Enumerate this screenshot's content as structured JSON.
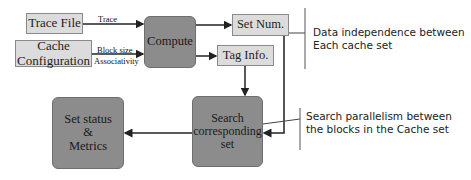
{
  "diagram": {
    "nodes": {
      "trace_file": {
        "label": "Trace File"
      },
      "cache_config": {
        "line1": "Cache",
        "line2": "Configuration"
      },
      "compute": {
        "label": "Compute"
      },
      "set_num": {
        "label": "Set Num."
      },
      "tag_info": {
        "label": "Tag Info."
      },
      "search": {
        "line1": "Search",
        "line2": "corresponding",
        "line3": "set"
      },
      "set_status": {
        "line1": "Set status",
        "line2": "&",
        "line3": "Metrics"
      }
    },
    "edges": {
      "trace": "Trace",
      "block_size": "Block size",
      "associativity": "Associativity"
    },
    "annotations": {
      "data_independence": {
        "line1": "Data independence between",
        "line2": "Each cache set"
      },
      "search_parallelism": {
        "line1": "Search parallelism between",
        "line2": "the blocks in the Cache set"
      }
    },
    "colors": {
      "light_box": "#dcdcdc",
      "dark_box": "#8c8c8c",
      "line": "#222222"
    }
  }
}
